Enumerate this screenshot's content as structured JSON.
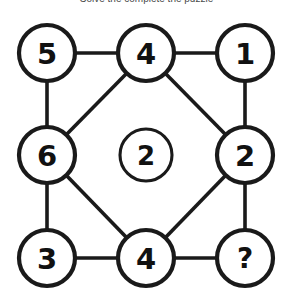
{
  "title": "Solve the complete the puzzle",
  "colors": {
    "background": "#ffffff",
    "stroke": "#1a1a1a",
    "label": "#111111",
    "title": "#4a4a4a"
  },
  "diagram": {
    "type": "node-link-graph",
    "layout": "3x3-grid-with-center",
    "nodes": [
      {
        "id": "top-left",
        "label": "5",
        "cx": 47,
        "cy": 53,
        "r": 28
      },
      {
        "id": "top-center",
        "label": "4",
        "cx": 146,
        "cy": 53,
        "r": 28
      },
      {
        "id": "top-right",
        "label": "1",
        "cx": 245,
        "cy": 53,
        "r": 28
      },
      {
        "id": "middle-left",
        "label": "6",
        "cx": 47,
        "cy": 155,
        "r": 28
      },
      {
        "id": "center",
        "label": "2",
        "cx": 146,
        "cy": 155,
        "r": 26
      },
      {
        "id": "middle-right",
        "label": "2",
        "cx": 245,
        "cy": 155,
        "r": 28
      },
      {
        "id": "bottom-left",
        "label": "3",
        "cx": 47,
        "cy": 258,
        "r": 28
      },
      {
        "id": "bottom-center",
        "label": "4",
        "cx": 146,
        "cy": 258,
        "r": 28
      },
      {
        "id": "bottom-right",
        "label": "?",
        "cx": 245,
        "cy": 258,
        "r": 28
      }
    ],
    "edges": [
      {
        "from": "top-left",
        "to": "top-center",
        "kind": "horizontal"
      },
      {
        "from": "top-center",
        "to": "top-right",
        "kind": "horizontal"
      },
      {
        "from": "bottom-left",
        "to": "bottom-center",
        "kind": "horizontal"
      },
      {
        "from": "bottom-center",
        "to": "bottom-right",
        "kind": "horizontal"
      },
      {
        "from": "top-left",
        "to": "middle-left",
        "kind": "vertical"
      },
      {
        "from": "middle-left",
        "to": "bottom-left",
        "kind": "vertical"
      },
      {
        "from": "top-right",
        "to": "middle-right",
        "kind": "vertical"
      },
      {
        "from": "middle-right",
        "to": "bottom-right",
        "kind": "vertical"
      },
      {
        "from": "middle-left",
        "to": "top-center",
        "kind": "diagonal"
      },
      {
        "from": "top-center",
        "to": "middle-right",
        "kind": "diagonal"
      },
      {
        "from": "middle-right",
        "to": "bottom-center",
        "kind": "diagonal"
      },
      {
        "from": "bottom-center",
        "to": "middle-left",
        "kind": "diagonal"
      }
    ],
    "unknown_node": "bottom-right",
    "unknown_symbol": "?"
  }
}
